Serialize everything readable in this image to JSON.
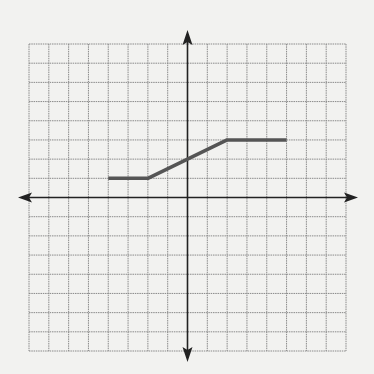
{
  "chart_data": {
    "type": "line",
    "title": "",
    "xlabel": "",
    "ylabel": "",
    "grid": true,
    "xlim": [
      -8,
      8
    ],
    "ylim": [
      -8,
      8
    ],
    "tick_labels": false,
    "series": [
      {
        "name": "piecewise-function",
        "color": "#555555",
        "points": [
          {
            "x": -4,
            "y": 1
          },
          {
            "x": -2,
            "y": 1
          },
          {
            "x": 2,
            "y": 3
          },
          {
            "x": 5,
            "y": 3
          }
        ]
      }
    ]
  },
  "colors": {
    "background": "#f2f2f0",
    "grid": "#8a8a8a",
    "axis": "#222222",
    "line": "#555555"
  }
}
